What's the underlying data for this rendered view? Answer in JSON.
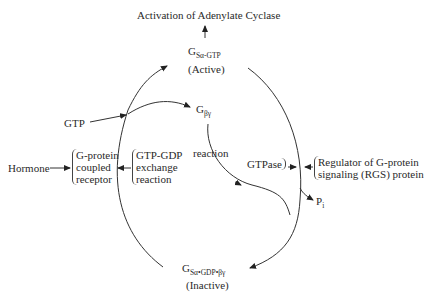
{
  "diagram": {
    "top_output": "Activation of Adenylate Cyclase",
    "active_state": {
      "symbol": "G",
      "subscript": "Sα-GTP",
      "label": "(Active)"
    },
    "inactive_state": {
      "symbol": "G",
      "subscript": "Sα•GDP•βγ",
      "label": "(Inactive)"
    },
    "beta_gamma": {
      "symbol": "G",
      "subscript": "βγ"
    },
    "gtp_input": "GTP",
    "hormone_input": "Hormone",
    "receptor": {
      "lines": [
        "G-protein",
        "coupled",
        "receptor"
      ]
    },
    "exchange": {
      "lines": [
        "GTP-GDP",
        "exchange",
        "reaction"
      ]
    },
    "reaction_label": "reaction",
    "gtpase_label": "GTPase",
    "rgs": {
      "lines": [
        "Regulator of G-protein",
        "signaling (RGS) protein"
      ]
    },
    "pi": {
      "symbol": "P",
      "subscript": "i"
    }
  }
}
